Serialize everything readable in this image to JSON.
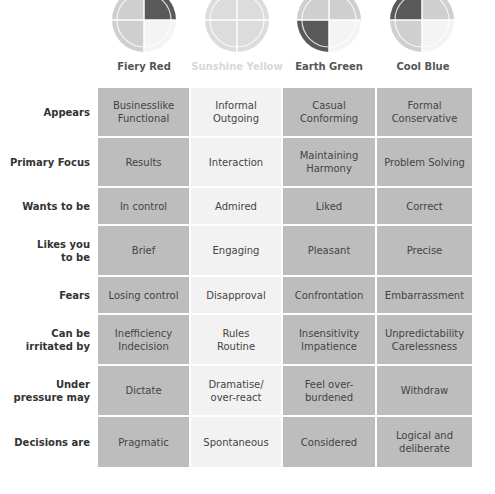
{
  "columns": [
    {
      "label": "Fiery Red",
      "icon": "quadrant-circle-top-right-dark",
      "faint": false
    },
    {
      "label": "Sunshine Yellow",
      "icon": "quadrant-circle-none-dark",
      "faint": true
    },
    {
      "label": "Earth Green",
      "icon": "quadrant-circle-bottom-left-dark",
      "faint": false
    },
    {
      "label": "Cool Blue",
      "icon": "quadrant-circle-top-left-dark",
      "faint": false
    }
  ],
  "colors": {
    "dark_cell": "#bdbdbd",
    "light_cell": "#f2f2f2",
    "dark_quadrant": "#595959",
    "mid_quadrant": "#cfcfcf",
    "light_quadrant": "#f4f4f4"
  },
  "rows": [
    {
      "label": "Appears",
      "cells": [
        "Businesslike\nFunctional",
        "Informal\nOutgoing",
        "Casual\nConforming",
        "Formal\nConservative"
      ]
    },
    {
      "label": "Primary Focus",
      "cells": [
        "Results",
        "Interaction",
        "Maintaining\nHarmony",
        "Problem Solving"
      ]
    },
    {
      "label": "Wants to be",
      "cells": [
        "In control",
        "Admired",
        "Liked",
        "Correct"
      ]
    },
    {
      "label": "Likes you\nto be",
      "cells": [
        "Brief",
        "Engaging",
        "Pleasant",
        "Precise"
      ]
    },
    {
      "label": "Fears",
      "cells": [
        "Losing control",
        "Disapproval",
        "Confrontation",
        "Embarrassment"
      ]
    },
    {
      "label": "Can be\nirritated by",
      "cells": [
        "Inefficiency\nIndecision",
        "Rules\nRoutine",
        "Insensitivity\nImpatience",
        "Unpredictability\nCarelessness"
      ]
    },
    {
      "label": "Under\npressure may",
      "cells": [
        "Dictate",
        "Dramatise/\nover-react",
        "Feel over-\nburdened",
        "Withdraw"
      ]
    },
    {
      "label": "Decisions are",
      "cells": [
        "Pragmatic",
        "Spontaneous",
        "Considered",
        "Logical and\ndeliberate"
      ]
    }
  ]
}
